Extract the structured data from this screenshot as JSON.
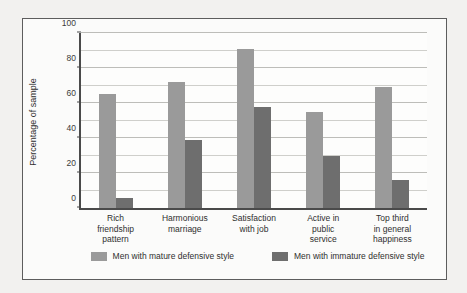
{
  "chart_data": {
    "type": "bar",
    "title": "",
    "xlabel": "",
    "ylabel": "Percentage of sample",
    "ylim": [
      0,
      100
    ],
    "yticks": [
      0,
      20,
      40,
      60,
      80,
      100
    ],
    "minor_tick_step": 10,
    "grid": true,
    "legend_position": "bottom",
    "categories": [
      "Rich\nfriendship\npattern",
      "Harmonious\nmarriage",
      "Satisfaction\nwith job",
      "Active in\npublic\nservice",
      "Top third\nin general\nhappiness"
    ],
    "series": [
      {
        "name": "Men with mature defensive style",
        "color": "#9a9a9a",
        "values": [
          65,
          72,
          91,
          55,
          69
        ]
      },
      {
        "name": "Men with immature defensive style",
        "color": "#6e6e6e",
        "values": [
          6,
          39,
          58,
          30,
          16
        ]
      }
    ]
  },
  "axis": {
    "tick_labels": [
      "0",
      "20",
      "40",
      "60",
      "80",
      "100"
    ],
    "y_axis_title": "Percentage of sample"
  },
  "legend": {
    "items": [
      {
        "label": "Men with mature defensive style",
        "color": "#9a9a9a"
      },
      {
        "label": "Men with immature defensive style",
        "color": "#6e6e6e"
      }
    ]
  },
  "colors": {
    "page_background": "#f2f1ef",
    "figure_background": "#fbfbfa",
    "frame_border": "#5d5d5d",
    "axis_line": "#4a4a4a",
    "gridline": "#cfcfcb",
    "mature_bar": "#9a9a9a",
    "immature_bar": "#6e6e6e",
    "text": "#2f2f2f"
  }
}
